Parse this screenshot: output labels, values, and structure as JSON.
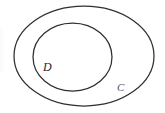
{
  "diagram": {
    "type": "venn-subset",
    "background_color": "#ffffff",
    "stroke_color": "#2f2f2f",
    "relation": "D is a subset of C",
    "outer_set": {
      "name": "outer-set-ellipse",
      "label": "C",
      "shape": "ellipse",
      "label_color": "#555555",
      "cx": 84,
      "cy": 56,
      "rx": 70,
      "ry": 50
    },
    "inner_set": {
      "name": "inner-set-circle",
      "label": "D",
      "shape": "ellipse",
      "label_color": "#232323",
      "cx": 72.5,
      "cy": 57,
      "rx": 39.5,
      "ry": 34
    }
  }
}
